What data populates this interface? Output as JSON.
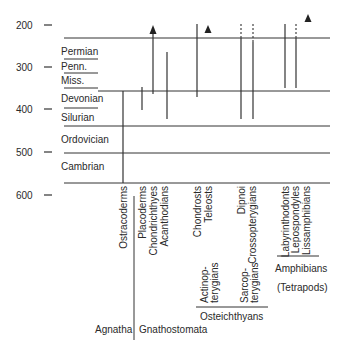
{
  "figure": {
    "type": "geologic-time-range-diagram",
    "axis": {
      "label_unit": "million years ago",
      "ticks": [
        {
          "value": "200",
          "y": 25
        },
        {
          "value": "300",
          "y": 67
        },
        {
          "value": "400",
          "y": 109
        },
        {
          "value": "500",
          "y": 152
        },
        {
          "value": "600",
          "y": 195
        }
      ]
    },
    "periods": [
      {
        "name": "Permian",
        "y": 53
      },
      {
        "name": "Penn.",
        "y": 69
      },
      {
        "name": "Miss.",
        "y": 84
      },
      {
        "name": "Devonian",
        "y": 101
      },
      {
        "name": "Silurian",
        "y": 121
      },
      {
        "name": "Ordovician",
        "y": 143
      },
      {
        "name": "Cambrian",
        "y": 171
      }
    ],
    "taxa": [
      {
        "name": "Ostracoderms",
        "x": 123
      },
      {
        "name": "Placoderms",
        "x": 142
      },
      {
        "name": "Chondrichthyes",
        "x": 153
      },
      {
        "name": "Acanthodians",
        "x": 165
      },
      {
        "name": "Chondrosts",
        "x": 197
      },
      {
        "name": "Teleosts",
        "x": 208
      },
      {
        "name": "Dipnoi",
        "x": 241
      },
      {
        "name": "Crossopterygians",
        "x": 253
      },
      {
        "name": "Labyrinthodonts",
        "x": 285
      },
      {
        "name": "Lepospondyles",
        "x": 295
      },
      {
        "name": "Lissamphibians",
        "x": 306
      }
    ],
    "subgroups": {
      "actinopterygians": [
        "Actinop-",
        "terygians"
      ],
      "sarcopterygians": [
        "Sarcop-",
        "terygians"
      ],
      "osteichthyans": "Osteichthyans",
      "amphibians": "Amphibians",
      "tetrapods": "(Tetrapods)"
    },
    "groups": {
      "agnatha": "Agnatha",
      "gnathostomata": "Gnathostomata"
    }
  }
}
